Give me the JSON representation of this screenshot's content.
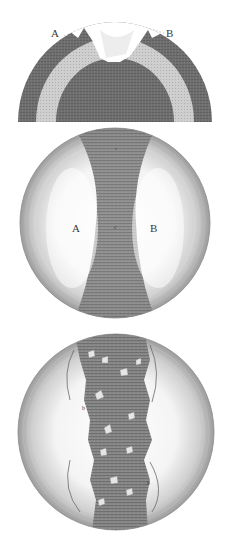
{
  "plate": {
    "figures": [
      {
        "id": "fig-section",
        "description": "Hemispherical cross-section with dark outer shell, light middle band, dark core and a broken notch at top",
        "labels": [
          {
            "text": "A",
            "x": 56,
            "y": 37
          },
          {
            "text": "B",
            "x": 168,
            "y": 37
          }
        ]
      },
      {
        "id": "fig-sphere-smooth",
        "description": "Sphere with a dark vertical hourglass-shaped band between two light lobes",
        "labels": [
          {
            "text": "A",
            "x": 77,
            "y": 231
          },
          {
            "text": "B",
            "x": 154,
            "y": 231
          },
          {
            "text": "c",
            "x": 116,
            "y": 230
          },
          {
            "text": "e",
            "x": 117,
            "y": 149
          }
        ]
      },
      {
        "id": "fig-sphere-fractured",
        "description": "Sphere with a dark vertical band containing light fragments, flanked by light fractured lobes",
        "labels": [
          {
            "text": "b",
            "x": 82,
            "y": 410
          },
          {
            "text": "b",
            "x": 147,
            "y": 485
          }
        ]
      }
    ],
    "colors": {
      "background": "#ffffff",
      "dark_fill": "#707070",
      "mid_fill": "#9a9a9a",
      "light_fill": "#d8d8d8",
      "hatch": "#555555",
      "label": "#3a3a3a"
    }
  }
}
